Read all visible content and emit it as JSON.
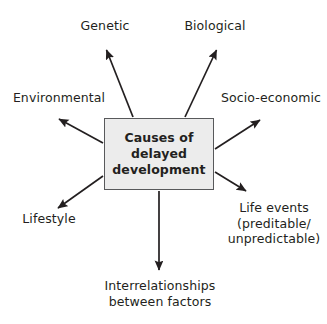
{
  "diagram": {
    "type": "radial-spider",
    "center": {
      "label": "Causes of\ndelayed\ndevelopment",
      "fill_color": "#ececec",
      "border_color": "#58595b"
    },
    "arrow_color": "#231f20",
    "nodes": [
      {
        "id": "genetic",
        "label": "Genetic",
        "direction": "up-left"
      },
      {
        "id": "biological",
        "label": "Biological",
        "direction": "up-right"
      },
      {
        "id": "environmental",
        "label": "Environmental",
        "direction": "left-up"
      },
      {
        "id": "socio",
        "label": "Socio-economic",
        "direction": "right-up"
      },
      {
        "id": "lifestyle",
        "label": "Lifestyle",
        "direction": "left-down"
      },
      {
        "id": "lifeevents",
        "label": "Life events\n(preditable/\nunpredictable)",
        "direction": "right-down"
      },
      {
        "id": "interrel",
        "label": "Interrelationships\nbetween factors",
        "direction": "down"
      }
    ]
  }
}
